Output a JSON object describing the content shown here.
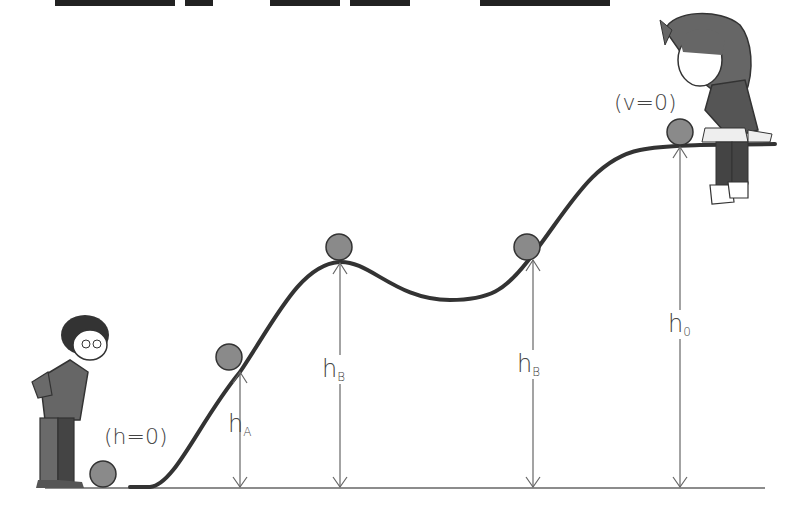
{
  "diagram": {
    "title_strip": "",
    "labels": {
      "start_condition": "(h=0)",
      "end_condition": "(v=0)",
      "h_A": {
        "main": "h",
        "sub": "A"
      },
      "h_B_left": {
        "main": "h",
        "sub": "B"
      },
      "h_B_right": {
        "main": "h",
        "sub": "B"
      },
      "h_0": {
        "main": "h",
        "sub": "0"
      }
    },
    "colors": {
      "curve": "#333333",
      "ball": "#8a8a8a",
      "arrow": "#666666",
      "ground": "#666666",
      "character": "#555555"
    },
    "balls": [
      {
        "name": "ball-ground",
        "x": 103,
        "y": 474
      },
      {
        "name": "ball-a",
        "x": 229,
        "y": 357
      },
      {
        "name": "ball-b-left",
        "x": 339,
        "y": 247
      },
      {
        "name": "ball-b-right",
        "x": 527,
        "y": 247
      },
      {
        "name": "ball-top",
        "x": 680,
        "y": 132
      }
    ]
  }
}
